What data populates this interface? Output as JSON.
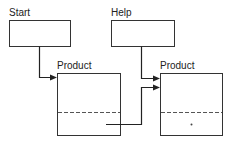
{
  "diagram": {
    "nodes": [
      {
        "id": "start",
        "label": "Start"
      },
      {
        "id": "help",
        "label": "Help"
      },
      {
        "id": "product_left",
        "label": "Product",
        "sections": 2
      },
      {
        "id": "product_right",
        "label": "Product",
        "sections": 2,
        "marker": "•"
      }
    ],
    "edges": [
      {
        "from": "start",
        "to": "product_left"
      },
      {
        "from": "help",
        "to": "product_right"
      },
      {
        "from": "product_left",
        "to": "product_right"
      }
    ]
  }
}
